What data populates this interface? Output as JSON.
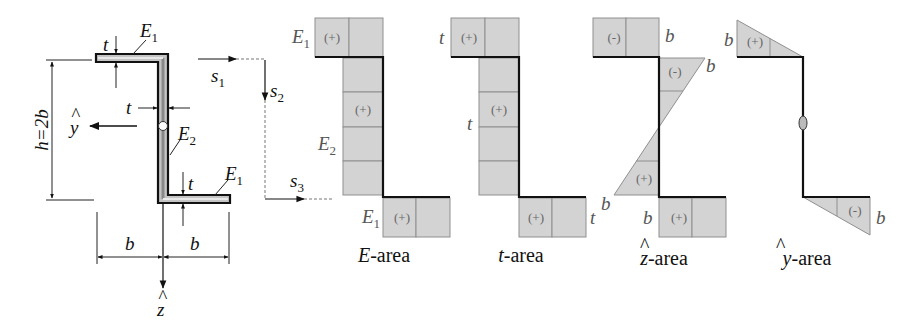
{
  "figure": {
    "cross_section": {
      "labels": {
        "t_top": "t",
        "E1_top": "E",
        "E1_top_sub": "1",
        "t_web": "t",
        "E2": "E",
        "E2_sub": "2",
        "t_bottom": "t",
        "E1_bottom": "E",
        "E1_bottom_sub": "1",
        "height": "h=2b",
        "b_left": "b",
        "b_right": "b",
        "y_axis": "y",
        "z_axis": "z"
      }
    },
    "path_coordinates": {
      "s1": "s",
      "s1_sub": "1",
      "s2": "s",
      "s2_sub": "2",
      "s3": "s",
      "s3_sub": "3"
    },
    "diagrams": [
      {
        "name": "E-area",
        "caption_var": "E",
        "caption_suffix": "-area",
        "top_label": "E",
        "top_label_sub": "1",
        "web_label": "E",
        "web_label_sub": "2",
        "bottom_label": "E",
        "bottom_label_sub": "1",
        "top_sign": "(+)",
        "web_sign": "(+)",
        "bottom_sign": "(+)"
      },
      {
        "name": "t-area",
        "caption_var": "t",
        "caption_suffix": "-area",
        "top_label": "t",
        "web_label": "t",
        "bottom_label": "t",
        "top_sign": "(+)",
        "web_sign": "(+)",
        "bottom_sign": "(+)"
      },
      {
        "name": "z-hat-area",
        "caption_var": "z",
        "caption_suffix": "-area",
        "top_label": "b",
        "web_top_label": "b",
        "web_bottom_label": "b",
        "bottom_label": "b",
        "top_sign": "(-)",
        "web_top_sign": "(-)",
        "web_bottom_sign": "(+)",
        "bottom_sign": "(+)"
      },
      {
        "name": "y-hat-area",
        "caption_var": "y",
        "caption_suffix": "-area",
        "top_label": "b",
        "web_label": "0",
        "bottom_label": "b",
        "top_sign": "(+)",
        "bottom_sign": "(-)"
      }
    ]
  }
}
